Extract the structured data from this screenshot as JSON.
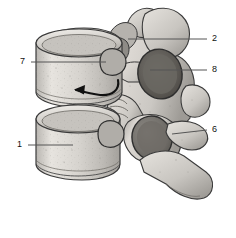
{
  "figure": {
    "background_color": "#ffffff",
    "line_color": "#555555",
    "label_color": "#111111",
    "arrow_color": "#111111"
  },
  "labels": [
    {
      "id": "7",
      "text": "7",
      "side": "left",
      "x": 24,
      "y": 62,
      "leader_from_x": 31,
      "leader_to_x": 106,
      "leader_y": 62
    },
    {
      "id": "1",
      "text": "1",
      "side": "left",
      "x": 21,
      "y": 145,
      "leader_from_x": 28,
      "leader_to_x": 73,
      "leader_y": 145
    },
    {
      "id": "2",
      "text": "2",
      "side": "right",
      "x": 214,
      "y": 39,
      "leader_from_x": 128,
      "leader_to_x": 207,
      "leader_y": 39
    },
    {
      "id": "8",
      "text": "8",
      "side": "right",
      "x": 214,
      "y": 70,
      "leader_from_x": 150,
      "leader_to_x": 207,
      "leader_y": 70
    },
    {
      "id": "6",
      "text": "6",
      "side": "right",
      "x": 214,
      "y": 130,
      "leader_from_x": 172,
      "leader_to_x": 207,
      "leader_y": 130
    }
  ],
  "annotations": [
    {
      "name": "disc-space-arrow",
      "description": "curved arrow pointing left into the intervertebral disc space",
      "tip_x": 74,
      "tip_y": 88
    }
  ],
  "structures": [
    {
      "name": "upper-vertebral-body",
      "label_ref": "7"
    },
    {
      "name": "lower-vertebral-body",
      "label_ref": "1"
    },
    {
      "name": "superior-articular-process",
      "label_ref": "2"
    },
    {
      "name": "pedicle-foramen",
      "label_ref": "8"
    },
    {
      "name": "transverse-process",
      "label_ref": "6"
    },
    {
      "name": "spinous-process",
      "label_ref": null
    },
    {
      "name": "intervertebral-disc-space",
      "label_ref": null
    }
  ]
}
